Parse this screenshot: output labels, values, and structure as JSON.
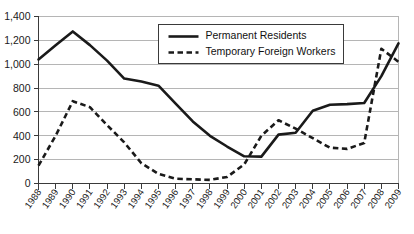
{
  "chart_data": {
    "type": "line",
    "title": "",
    "subtitle": "",
    "xlabel": "",
    "ylabel": "",
    "grid": true,
    "legend_position": "inside-top-right",
    "xlim": [
      1988,
      2009
    ],
    "ylim": [
      0,
      1400
    ],
    "yticks": [
      0,
      200,
      400,
      600,
      800,
      1000,
      1200,
      1400
    ],
    "ytick_labels": [
      "0",
      "200",
      "400",
      "600",
      "800",
      "1,000",
      "1,200",
      "1,400"
    ],
    "categories": [
      "1988",
      "1989",
      "1990",
      "1991",
      "1992",
      "1993",
      "1994",
      "1995",
      "1996",
      "1997",
      "1998",
      "1999",
      "2000",
      "2001",
      "2002",
      "2003",
      "2004",
      "2005",
      "2006",
      "2007",
      "2008",
      "2009"
    ],
    "series": [
      {
        "name": "Permanent Residents",
        "style": "solid",
        "color": "#1a1a1a",
        "values": [
          1040,
          1160,
          1275,
          1160,
          1030,
          880,
          855,
          820,
          670,
          520,
          400,
          310,
          228,
          225,
          410,
          425,
          610,
          660,
          665,
          675,
          900,
          1175
        ]
      },
      {
        "name": "Temporary Foreign Workers",
        "style": "dashed",
        "color": "#1a1a1a",
        "values": [
          150,
          400,
          690,
          640,
          490,
          345,
          170,
          80,
          40,
          35,
          30,
          55,
          160,
          400,
          530,
          460,
          380,
          300,
          290,
          340,
          1130,
          1020
        ]
      }
    ]
  },
  "legend": {
    "items": [
      {
        "label": "Permanent Residents",
        "style": "solid"
      },
      {
        "label": "Temporary Foreign Workers",
        "style": "dashed"
      }
    ]
  }
}
